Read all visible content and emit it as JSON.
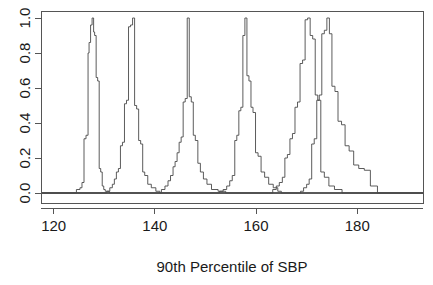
{
  "chart_data": {
    "type": "line",
    "title": "",
    "xlabel": "90th Percentile of SBP",
    "ylabel": "",
    "xlim": [
      117.5,
      193.0
    ],
    "ylim": [
      0.0,
      1.04
    ],
    "grid": false,
    "legend": null,
    "xticks": [
      120,
      140,
      160,
      180
    ],
    "xtick_labels": [
      "120",
      "140",
      "160",
      "180"
    ],
    "yticks": [
      0.0,
      0.2,
      0.4,
      0.6,
      0.8,
      1.0
    ],
    "ytick_labels": [
      "0.0",
      "0.2",
      "0.4",
      "0.6",
      "0.8",
      "1.0"
    ],
    "series": [
      {
        "name": "curve-1",
        "peak_x": 128.0,
        "x": [
          117.5,
          123.8,
          124.5,
          125.2,
          125.6,
          126.0,
          126.4,
          126.8,
          127.0,
          127.3,
          127.6,
          127.9,
          128.1,
          128.4,
          128.7,
          129.0,
          129.3,
          129.6,
          129.9,
          130.2,
          130.6,
          131.0,
          131.6,
          132.3,
          133.0,
          193.0
        ],
        "y": [
          0.0,
          0.0,
          0.02,
          0.03,
          0.06,
          0.31,
          0.33,
          0.8,
          0.86,
          0.96,
          1.0,
          0.92,
          0.9,
          0.66,
          0.64,
          0.14,
          0.12,
          0.04,
          0.02,
          0.01,
          0.01,
          0.0,
          0.0,
          0.0,
          0.0,
          0.0
        ]
      },
      {
        "name": "curve-2",
        "peak_x": 135.8,
        "x": [
          117.5,
          129.8,
          130.5,
          131.1,
          131.6,
          132.0,
          132.4,
          132.8,
          133.2,
          133.6,
          134.0,
          134.4,
          134.8,
          135.2,
          135.6,
          136.0,
          136.4,
          136.8,
          137.2,
          137.6,
          138.0,
          138.6,
          139.3,
          140.2,
          141.0,
          193.0
        ],
        "y": [
          0.0,
          0.0,
          0.01,
          0.03,
          0.05,
          0.08,
          0.12,
          0.14,
          0.27,
          0.29,
          0.51,
          0.53,
          0.95,
          0.96,
          1.0,
          0.5,
          0.48,
          0.3,
          0.28,
          0.12,
          0.1,
          0.05,
          0.03,
          0.01,
          0.0,
          0.0
        ]
      },
      {
        "name": "curve-3",
        "peak_x": 146.6,
        "x": [
          117.5,
          140.5,
          141.3,
          142.0,
          142.6,
          143.1,
          143.6,
          144.0,
          144.4,
          144.8,
          145.2,
          145.6,
          146.0,
          146.4,
          146.8,
          147.2,
          147.6,
          148.0,
          148.5,
          149.0,
          149.6,
          150.3,
          151.2,
          152.5,
          154.0,
          193.0
        ],
        "y": [
          0.0,
          0.0,
          0.02,
          0.04,
          0.07,
          0.1,
          0.15,
          0.18,
          0.23,
          0.29,
          0.32,
          0.52,
          0.54,
          1.0,
          0.55,
          0.52,
          0.33,
          0.3,
          0.17,
          0.12,
          0.08,
          0.05,
          0.02,
          0.01,
          0.0,
          0.0
        ]
      },
      {
        "name": "curve-4",
        "peak_x": 157.9,
        "x": [
          117.5,
          152.0,
          152.8,
          153.5,
          154.2,
          154.8,
          155.3,
          155.8,
          156.2,
          156.6,
          157.0,
          157.4,
          157.8,
          158.2,
          158.6,
          159.0,
          159.4,
          159.9,
          160.4,
          161.0,
          161.7,
          162.5,
          163.4,
          164.3,
          165.0,
          193.0
        ],
        "y": [
          0.0,
          0.0,
          0.01,
          0.02,
          0.04,
          0.07,
          0.1,
          0.3,
          0.33,
          0.47,
          0.49,
          0.9,
          1.0,
          0.67,
          0.64,
          0.49,
          0.46,
          0.23,
          0.21,
          0.12,
          0.09,
          0.05,
          0.03,
          0.01,
          0.0,
          0.0
        ]
      },
      {
        "name": "curve-5",
        "peak_x": 170.2,
        "x": [
          117.5,
          162.5,
          163.3,
          164.0,
          164.6,
          165.2,
          165.7,
          166.2,
          166.7,
          167.2,
          167.7,
          168.2,
          168.7,
          169.2,
          169.7,
          170.2,
          170.7,
          171.2,
          171.7,
          172.2,
          172.8,
          173.5,
          174.4,
          175.5,
          177.0,
          193.0
        ],
        "y": [
          0.0,
          0.0,
          0.02,
          0.04,
          0.06,
          0.09,
          0.2,
          0.22,
          0.31,
          0.34,
          0.49,
          0.52,
          0.74,
          0.76,
          0.99,
          1.0,
          0.9,
          0.88,
          0.56,
          0.53,
          0.12,
          0.09,
          0.04,
          0.02,
          0.0,
          0.0
        ]
      },
      {
        "name": "curve-6",
        "peak_x": 174.3,
        "x": [
          117.5,
          168.0,
          168.8,
          169.4,
          170.0,
          170.5,
          171.0,
          171.5,
          172.0,
          172.5,
          173.0,
          173.5,
          174.0,
          174.5,
          175.0,
          175.6,
          176.2,
          176.9,
          177.6,
          178.4,
          179.3,
          180.3,
          181.4,
          182.6,
          184.0,
          193.0
        ],
        "y": [
          0.0,
          0.0,
          0.01,
          0.03,
          0.05,
          0.08,
          0.28,
          0.31,
          0.53,
          0.56,
          0.91,
          0.93,
          1.0,
          0.91,
          0.61,
          0.58,
          0.41,
          0.39,
          0.27,
          0.24,
          0.16,
          0.14,
          0.13,
          0.04,
          0.0,
          0.0
        ]
      }
    ]
  },
  "figure": {
    "background_color": "#ffffff",
    "line_color": "#4a4a4a",
    "axis_color": "#555555",
    "text_color": "#1a1a1a"
  }
}
